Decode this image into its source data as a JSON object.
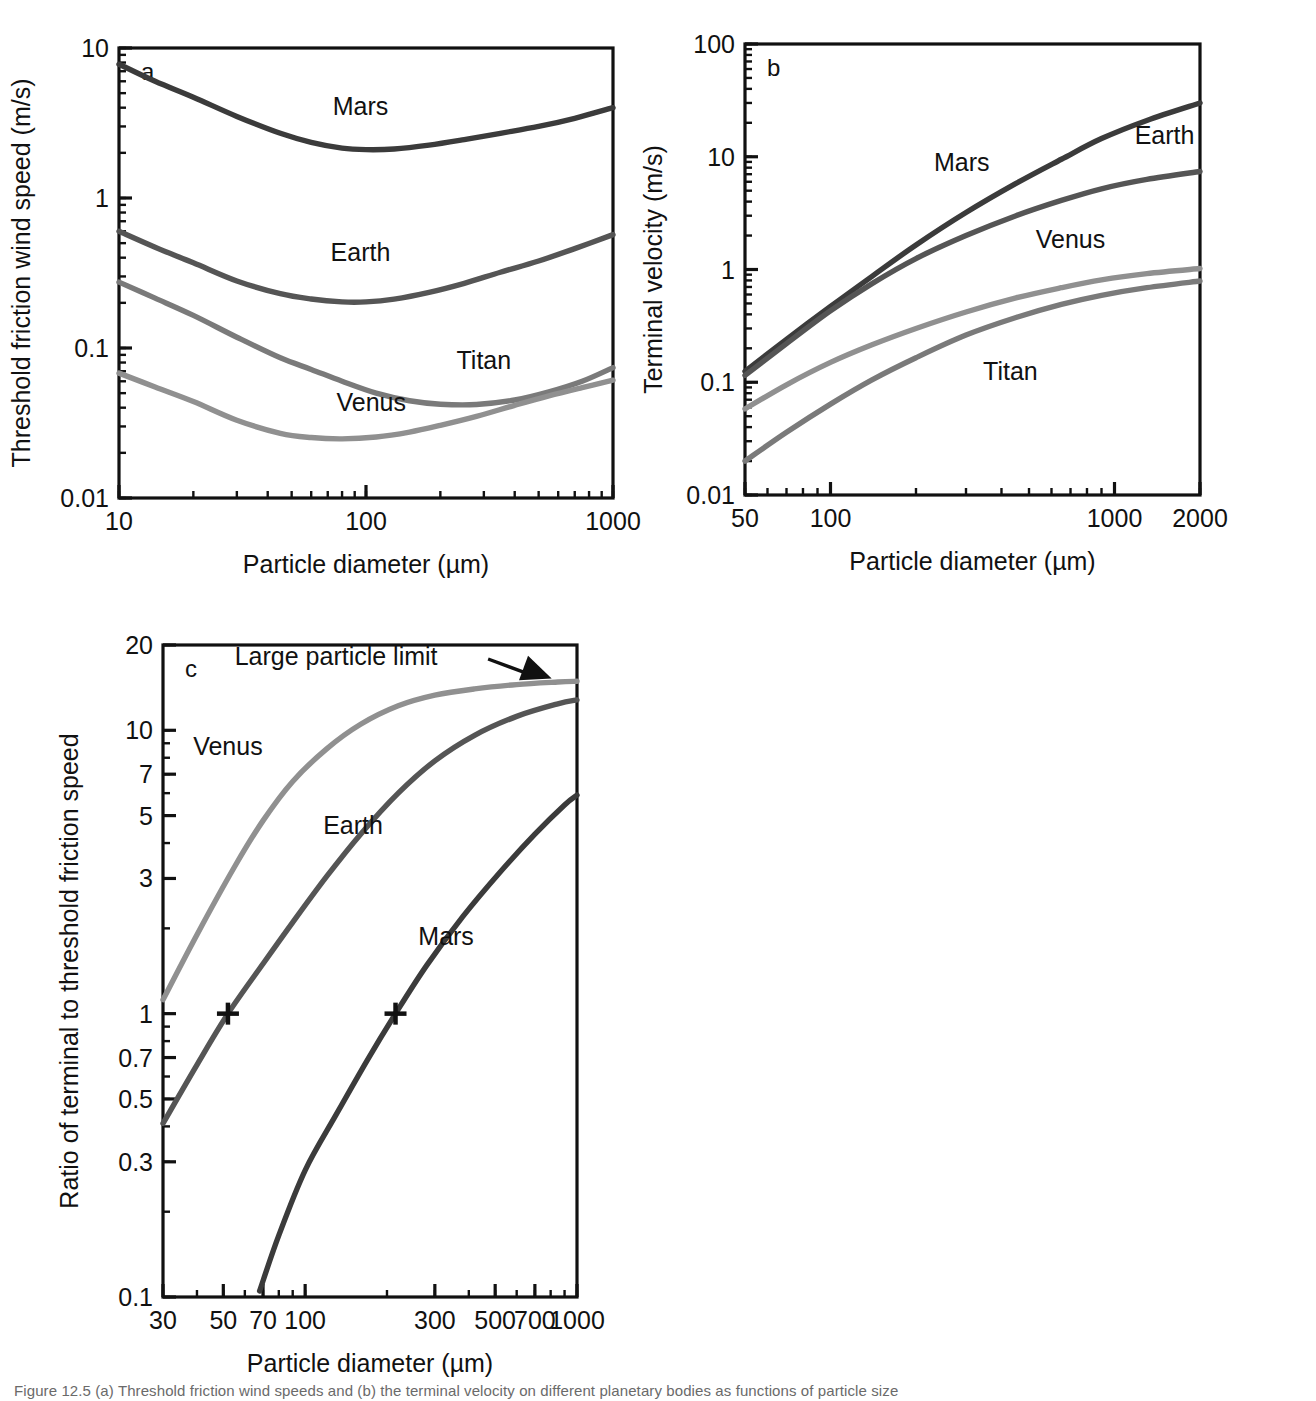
{
  "figure": {
    "background": "#ffffff",
    "caption_partial": "Figure 12.5 (a) Threshold friction wind speeds and (b) the terminal velocity on different planetary bodies as functions of particle size"
  },
  "colors": {
    "mars": "#3b3b3b",
    "earth": "#555555",
    "titan": "#7a7a7a",
    "venus": "#909090",
    "axis": "#111111",
    "text": "#111111",
    "arrow": "#111111"
  },
  "chart_data": [
    {
      "id": "panel-a",
      "type": "line",
      "panel_letter": "a",
      "title": "",
      "xlabel": "Particle diameter (µm)",
      "ylabel": "Threshold friction wind speed (m/s)",
      "xscale": "log",
      "yscale": "log",
      "xlim": [
        10,
        1000
      ],
      "ylim": [
        0.01,
        10
      ],
      "xticks": [
        10,
        100,
        1000
      ],
      "xticklabels": [
        "10",
        "100",
        "1000"
      ],
      "yticks": [
        0.01,
        0.1,
        1,
        10
      ],
      "yticklabels": [
        "0.01",
        "0.1",
        "1",
        "10"
      ],
      "grid": false,
      "legend": "inline-labels",
      "series": [
        {
          "name": "Mars",
          "color": "#3b3b3b",
          "label_x": 95,
          "label_y": 3.6,
          "x": [
            10,
            14,
            20,
            30,
            45,
            60,
            80,
            100,
            130,
            180,
            250,
            350,
            500,
            700,
            1000
          ],
          "y": [
            7.8,
            6.0,
            4.7,
            3.5,
            2.7,
            2.35,
            2.15,
            2.1,
            2.12,
            2.25,
            2.45,
            2.7,
            3.0,
            3.4,
            4.0
          ]
        },
        {
          "name": "Earth",
          "color": "#555555",
          "label_x": 95,
          "label_y": 0.38,
          "x": [
            10,
            14,
            20,
            30,
            45,
            60,
            80,
            100,
            130,
            180,
            250,
            350,
            500,
            700,
            1000
          ],
          "y": [
            0.6,
            0.47,
            0.37,
            0.28,
            0.23,
            0.212,
            0.203,
            0.203,
            0.212,
            0.235,
            0.27,
            0.32,
            0.38,
            0.46,
            0.57
          ]
        },
        {
          "name": "Titan",
          "color": "#7a7a7a",
          "label_x": 300,
          "label_y": 0.072,
          "x": [
            10,
            14,
            20,
            30,
            45,
            60,
            80,
            110,
            150,
            200,
            280,
            400,
            550,
            750,
            1000
          ],
          "y": [
            0.275,
            0.215,
            0.165,
            0.118,
            0.086,
            0.072,
            0.06,
            0.05,
            0.0445,
            0.0422,
            0.042,
            0.045,
            0.051,
            0.06,
            0.074
          ]
        },
        {
          "name": "Venus",
          "color": "#909090",
          "label_x": 105,
          "label_y": 0.038,
          "x": [
            10,
            14,
            20,
            30,
            45,
            60,
            80,
            110,
            150,
            200,
            280,
            400,
            550,
            750,
            1000
          ],
          "y": [
            0.068,
            0.055,
            0.044,
            0.033,
            0.027,
            0.0253,
            0.0248,
            0.0255,
            0.0275,
            0.0305,
            0.035,
            0.0415,
            0.048,
            0.0545,
            0.061
          ]
        }
      ]
    },
    {
      "id": "panel-b",
      "type": "line",
      "panel_letter": "b",
      "title": "",
      "xlabel": "Particle diameter (µm)",
      "ylabel": "Terminal velocity (m/s)",
      "xscale": "log",
      "yscale": "log",
      "xlim": [
        50,
        2000
      ],
      "ylim": [
        0.01,
        100
      ],
      "xticks": [
        50,
        100,
        1000,
        2000
      ],
      "xticklabels": [
        "50",
        "100",
        "1000",
        "2000"
      ],
      "yticks": [
        0.01,
        0.1,
        1,
        10,
        100
      ],
      "yticklabels": [
        "0.01",
        "0.1",
        "1",
        "10",
        "100"
      ],
      "grid": false,
      "legend": "inline-labels",
      "series": [
        {
          "name": "Mars",
          "color": "#3b3b3b",
          "label_x": 290,
          "label_y": 7.5,
          "x": [
            50,
            70,
            100,
            140,
            200,
            300,
            450,
            650,
            900,
            1300,
            2000
          ],
          "y": [
            0.125,
            0.24,
            0.47,
            0.87,
            1.65,
            3.2,
            5.8,
            9.5,
            14.5,
            21.0,
            30.0
          ]
        },
        {
          "name": "Earth",
          "color": "#555555",
          "label_x": 1500,
          "label_y": 13.0,
          "x": [
            50,
            70,
            100,
            140,
            200,
            300,
            450,
            650,
            900,
            1300,
            2000
          ],
          "y": [
            0.115,
            0.22,
            0.43,
            0.75,
            1.25,
            2.0,
            3.0,
            4.1,
            5.2,
            6.3,
            7.4
          ]
        },
        {
          "name": "Venus",
          "color": "#909090",
          "label_x": 700,
          "label_y": 1.55,
          "x": [
            50,
            70,
            100,
            140,
            200,
            300,
            450,
            650,
            900,
            1300,
            2000
          ],
          "y": [
            0.058,
            0.095,
            0.15,
            0.215,
            0.3,
            0.42,
            0.56,
            0.69,
            0.81,
            0.92,
            1.02
          ]
        },
        {
          "name": "Titan",
          "color": "#7a7a7a",
          "label_x": 430,
          "label_y": 0.105,
          "x": [
            50,
            70,
            100,
            140,
            200,
            300,
            450,
            650,
            900,
            1300,
            2000
          ],
          "y": [
            0.02,
            0.036,
            0.064,
            0.105,
            0.165,
            0.262,
            0.375,
            0.49,
            0.59,
            0.69,
            0.79
          ]
        }
      ]
    },
    {
      "id": "panel-c",
      "type": "line",
      "panel_letter": "c",
      "title": "",
      "xlabel": "Particle diameter (µm)",
      "ylabel": "Ratio of terminal to threshold friction speed",
      "xscale": "log",
      "yscale": "log",
      "xlim": [
        30,
        1000
      ],
      "ylim": [
        0.1,
        20
      ],
      "xticks": [
        30,
        50,
        70,
        100,
        300,
        500,
        700,
        1000
      ],
      "xticklabels": [
        "30",
        "50",
        "70",
        "100",
        "300",
        "500",
        "700",
        "1000"
      ],
      "yticks": [
        0.1,
        0.3,
        0.5,
        0.7,
        1,
        3,
        5,
        7,
        10,
        20
      ],
      "yticklabels": [
        "0.1",
        "0.3",
        "0.5",
        "0.7",
        "1",
        "3",
        "5",
        "7",
        "10",
        "20"
      ],
      "grid": false,
      "legend": "inline-labels",
      "annotations": [
        {
          "name": "large-particle-limit",
          "text": "Large particle limit",
          "x": 130,
          "y": 17.0,
          "arrow_to_x": 780,
          "arrow_to_y": 15.0
        }
      ],
      "markers": [
        {
          "name": "earth-threshold-crossing",
          "symbol": "+",
          "x": 52,
          "y": 1.0
        },
        {
          "name": "mars-threshold-crossing",
          "symbol": "+",
          "x": 215,
          "y": 1.0
        }
      ],
      "series": [
        {
          "name": "Venus",
          "color": "#909090",
          "label_x": 52,
          "label_y": 8.2,
          "x": [
            30,
            40,
            55,
            70,
            90,
            120,
            160,
            220,
            300,
            420,
            600,
            850,
            1000
          ],
          "y": [
            1.12,
            1.9,
            3.3,
            4.8,
            6.6,
            8.6,
            10.5,
            12.2,
            13.3,
            14.0,
            14.5,
            14.8,
            14.9
          ]
        },
        {
          "name": "Earth",
          "color": "#555555",
          "label_x": 150,
          "label_y": 4.3,
          "x": [
            30,
            40,
            52,
            70,
            90,
            120,
            160,
            220,
            300,
            420,
            600,
            850,
            1000
          ],
          "y": [
            0.41,
            0.66,
            1.0,
            1.5,
            2.1,
            3.05,
            4.3,
            6.0,
            7.8,
            9.6,
            11.2,
            12.4,
            12.8
          ]
        },
        {
          "name": "Mars",
          "color": "#3b3b3b",
          "label_x": 330,
          "label_y": 1.75,
          "x": [
            68,
            80,
            100,
            130,
            170,
            215,
            280,
            380,
            520,
            700,
            900,
            1000
          ],
          "y": [
            0.105,
            0.165,
            0.28,
            0.44,
            0.69,
            1.0,
            1.48,
            2.2,
            3.15,
            4.3,
            5.45,
            5.9
          ]
        }
      ]
    }
  ]
}
